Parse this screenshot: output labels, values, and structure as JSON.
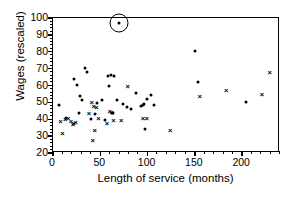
{
  "chart_data": {
    "type": "scatter",
    "title": "",
    "xlabel": "Length of service (months)",
    "ylabel": "Wages (rescaled)",
    "xlim": [
      0,
      240
    ],
    "ylim": [
      20,
      100
    ],
    "xticks": [
      0,
      50,
      100,
      150,
      200
    ],
    "yticks": [
      20,
      30,
      40,
      50,
      60,
      70,
      80,
      90,
      100
    ],
    "xtick_labels": [
      "0",
      "50",
      "100",
      "150",
      "200"
    ],
    "ytick_labels": [
      "20",
      "30",
      "40",
      "50",
      "60",
      "70",
      "80",
      "90",
      "100"
    ],
    "x_minor_tick_step": 10,
    "y_minor_tick_step": 2,
    "grid": false,
    "legend": "none",
    "annotations": [
      {
        "name": "circled-outlier",
        "shape": "circle",
        "x": 70,
        "y": 97,
        "radius_px": 9.5
      }
    ],
    "series": [
      {
        "name": "dot-markers",
        "marker": "filled-circle",
        "color": "#000000",
        "points": [
          [
            6,
            48.5
          ],
          [
            14,
            41.0
          ],
          [
            22,
            64.0
          ],
          [
            25,
            60.5
          ],
          [
            27,
            43.5
          ],
          [
            29,
            54.0
          ],
          [
            31,
            51.5
          ],
          [
            34,
            70.5
          ],
          [
            36,
            68.0
          ],
          [
            40,
            40.0
          ],
          [
            44,
            43.0
          ],
          [
            47,
            49.5
          ],
          [
            52,
            51.5
          ],
          [
            55,
            39.5
          ],
          [
            58,
            65.5
          ],
          [
            59,
            60.0
          ],
          [
            61,
            66.5
          ],
          [
            62,
            44.0
          ],
          [
            63,
            43.5
          ],
          [
            65,
            65.5
          ],
          [
            68,
            51.5
          ],
          [
            70,
            97.0
          ],
          [
            74,
            49.0
          ],
          [
            78,
            47.5
          ],
          [
            82,
            46.0
          ],
          [
            88,
            55.5
          ],
          [
            93,
            48.0
          ],
          [
            95,
            48.5
          ],
          [
            96,
            49.0
          ],
          [
            97,
            34.5
          ],
          [
            99,
            52.0
          ],
          [
            104,
            54.5
          ],
          [
            107,
            48.5
          ],
          [
            150,
            80.5
          ],
          [
            153,
            62.0
          ],
          [
            204,
            50.5
          ]
        ]
      },
      {
        "name": "cross-markers",
        "marker": "x-cross",
        "color": "#000000",
        "points": [
          [
            8,
            39.0
          ],
          [
            10,
            32.0
          ],
          [
            13,
            40.0
          ],
          [
            16,
            40.5
          ],
          [
            19,
            39.0
          ],
          [
            21,
            37.0
          ],
          [
            22,
            37.5
          ],
          [
            24,
            38.5
          ],
          [
            38,
            43.5
          ],
          [
            41,
            50.0
          ],
          [
            42,
            27.5
          ],
          [
            43,
            48.0
          ],
          [
            44,
            33.5
          ],
          [
            46,
            47.5
          ],
          [
            48,
            40.5
          ],
          [
            57,
            38.0
          ],
          [
            60,
            45.0
          ],
          [
            62,
            44.5
          ],
          [
            64,
            39.5
          ],
          [
            72,
            39.5
          ],
          [
            79,
            59.5
          ],
          [
            95,
            41.0
          ],
          [
            99,
            41.0
          ],
          [
            124,
            33.5
          ],
          [
            155,
            54.0
          ],
          [
            183,
            57.5
          ],
          [
            221,
            55.0
          ],
          [
            229,
            68.0
          ]
        ]
      }
    ]
  }
}
